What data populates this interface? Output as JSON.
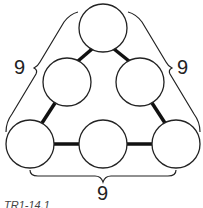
{
  "diagram": {
    "type": "magic-triangle-puzzle",
    "circles": [
      {
        "id": "top",
        "cx": 103,
        "cy": 28,
        "r": 24,
        "value": ""
      },
      {
        "id": "mid-left",
        "cx": 67,
        "cy": 82,
        "r": 24,
        "value": ""
      },
      {
        "id": "mid-right",
        "cx": 140,
        "cy": 82,
        "r": 24,
        "value": ""
      },
      {
        "id": "bottom-left",
        "cx": 30,
        "cy": 144,
        "r": 24,
        "value": ""
      },
      {
        "id": "bottom-mid",
        "cx": 103,
        "cy": 144,
        "r": 24,
        "value": ""
      },
      {
        "id": "bottom-right",
        "cx": 176,
        "cy": 144,
        "r": 24,
        "value": ""
      }
    ],
    "side_sums": {
      "left": "9",
      "right": "9",
      "bottom": "9"
    },
    "caption": "TR1-14.1"
  }
}
